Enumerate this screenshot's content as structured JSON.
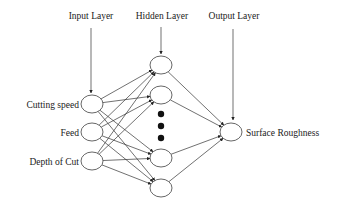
{
  "layers": {
    "input_title": "Input Layer",
    "hidden_title": "Hidden Layer",
    "output_title": "Output Layer"
  },
  "inputs": [
    {
      "label": "Cutting speed"
    },
    {
      "label": "Feed"
    },
    {
      "label": "Depth of Cut"
    }
  ],
  "hidden": {
    "visible_nodes": 4,
    "ellipsis_dots": 3
  },
  "output": {
    "label": "Surface Roughness"
  },
  "connectivity": "fully-connected"
}
